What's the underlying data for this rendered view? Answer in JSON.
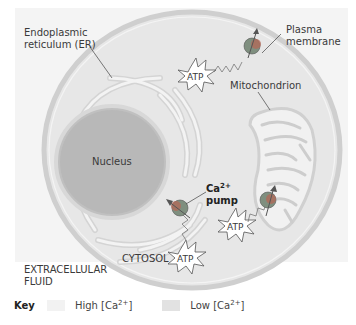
{
  "labels": {
    "er": [
      "Endoplasmic",
      "reticulum (ER)"
    ],
    "plasma_membrane": [
      "Plasma",
      "membrane"
    ],
    "mitochondrion": "Mitochondrion",
    "nucleus": "Nucleus",
    "pump_main": "Ca",
    "pump_sup": "2+",
    "pump_word": "pump",
    "cytosol": "CYTOSOL",
    "extracellular": [
      "EXTRACELLULAR",
      "FLUID"
    ],
    "atp": "ATP"
  },
  "key": {
    "title": "Key",
    "items": [
      {
        "label_pre": "High [Ca",
        "label_sup": "2+",
        "label_post": "]",
        "color": "#f2f2f2"
      },
      {
        "label_pre": "Low [Ca",
        "label_sup": "2+",
        "label_post": "]",
        "color": "#e2e2e2"
      }
    ]
  },
  "colors": {
    "extracellular_bg": "#f4f4f4",
    "cytosol_fill": "#e6e6e6",
    "membrane": "#c9c9c9",
    "nucleus_fill": "#b9b9b9",
    "er_fill": "#f3f3f3",
    "pump_body": "#7f8f7f",
    "pump_accent": "#b05a4a"
  }
}
